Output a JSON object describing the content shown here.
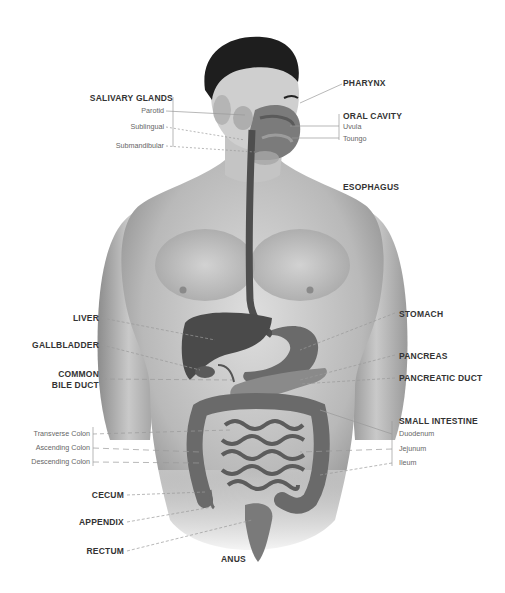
{
  "diagram": {
    "colors": {
      "skin_light": "#d9d9d9",
      "skin_mid": "#b8b8b8",
      "skin_dark": "#8a8a8a",
      "hair": "#1e1e1e",
      "organ_dark": "#4a4a4a",
      "organ_mid": "#6e6e6e",
      "label": "#333333",
      "sublabel": "#666666",
      "leader": "#9a9a9a"
    },
    "labels_left": {
      "salivary_glands": {
        "title": "SALIVARY GLANDS",
        "parts": [
          "Parotid",
          "Sublingual",
          "Submandibular"
        ]
      },
      "liver": "LIVER",
      "gallbladder": "GALLBLADDER",
      "common_bile_duct": [
        "COMMON",
        "BILE DUCT"
      ],
      "colon_parts": [
        "Transverse Colon",
        "Ascending Colon",
        "Descending Colon"
      ],
      "cecum": "CECUM",
      "appendix": "APPENDIX",
      "rectum": "RECTUM"
    },
    "labels_right": {
      "pharynx": "PHARYNX",
      "oral_cavity": {
        "title": "ORAL CAVITY",
        "parts": [
          "Uvula",
          "Toungo"
        ]
      },
      "esophagus": "ESOPHAGUS",
      "stomach": "STOMACH",
      "pancreas": "PANCREAS",
      "pancreatic_duct": "PANCREATIC DUCT",
      "small_intestine": {
        "title": "SMALL INTESTINE",
        "parts": [
          "Duodenum",
          "Jejunum",
          "Ileum"
        ]
      }
    },
    "labels_bottom": {
      "anus": "ANUS"
    }
  }
}
